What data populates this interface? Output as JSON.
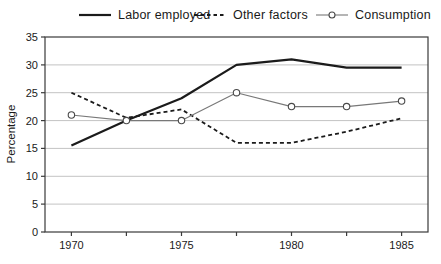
{
  "figure": {
    "background": "#ffffff"
  },
  "chart_data": {
    "type": "line",
    "title": "",
    "ylabel": "Percentage",
    "xlabel": "",
    "ylim": [
      0,
      35
    ],
    "yticks": [
      0,
      5,
      10,
      15,
      20,
      25,
      30,
      35
    ],
    "x": [
      1970,
      1972.5,
      1975,
      1977.5,
      1980,
      1982.5,
      1985
    ],
    "xticks_minor": [
      1970,
      1972.5,
      1975,
      1977.5,
      1980,
      1982.5,
      1985
    ],
    "xticks_labeled": [
      "1970",
      "1975",
      "1980",
      "1985"
    ],
    "xticks_labeled_values": [
      1970,
      1975,
      1980,
      1985
    ],
    "x_axis_range": [
      1968.8,
      1986.2
    ],
    "grid": true,
    "legend_position": "top",
    "series": [
      {
        "name": "Labor employed",
        "slug": "labor-employed",
        "values": [
          15.5,
          20,
          24,
          30,
          31,
          29.5,
          29.5
        ],
        "color": "#1b1b1b",
        "width": 2.2,
        "dash": "",
        "marker": "none"
      },
      {
        "name": "Other factors",
        "slug": "other-factors",
        "values": [
          25,
          20.5,
          22,
          16,
          16,
          18,
          20.4
        ],
        "color": "#1b1b1b",
        "width": 1.8,
        "dash": "4 3",
        "marker": "none"
      },
      {
        "name": "Consumption",
        "slug": "consumption",
        "values": [
          21,
          20,
          20,
          25,
          22.5,
          22.5,
          23.5
        ],
        "color": "#787878",
        "width": 1.1,
        "dash": "",
        "marker": "circle",
        "marker_color": "#4a4a4a"
      }
    ],
    "colors": {
      "grid": "#c3c3c3",
      "frame": "#3a3a3a",
      "text": "#1a1a1a"
    }
  }
}
